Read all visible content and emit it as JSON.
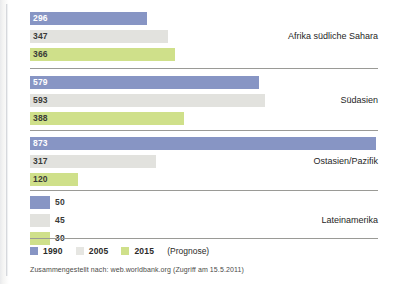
{
  "chart_data": {
    "type": "bar",
    "title": "",
    "xlabel": "",
    "ylabel": "",
    "orientation": "horizontal",
    "grid": false,
    "legend_position": "bottom-left",
    "xlim": [
      0,
      880
    ],
    "categories": [
      "Afrika südliche Sahara",
      "Südasien",
      "Ostasien/Pazifik",
      "Lateinamerika"
    ],
    "series": [
      {
        "name": "1990",
        "color": "#8795c4",
        "values": [
          296,
          579,
          873,
          50
        ]
      },
      {
        "name": "2005",
        "color": "#e2e2de",
        "values": [
          347,
          593,
          317,
          45
        ]
      },
      {
        "name": "2015",
        "color": "#cfe08a",
        "values": [
          366,
          388,
          120,
          30
        ]
      }
    ],
    "legend_note": "(Prognose)",
    "source": "Zusammengestellt nach: web.worldbank.org (Zugriff am 15.5.2011)"
  },
  "groups": [
    {
      "label": "Afrika südliche Sahara",
      "bars": [
        {
          "series": "1990",
          "value": "296"
        },
        {
          "series": "2005",
          "value": "347"
        },
        {
          "series": "2015",
          "value": "366"
        }
      ]
    },
    {
      "label": "Südasien",
      "bars": [
        {
          "series": "1990",
          "value": "579"
        },
        {
          "series": "2005",
          "value": "593"
        },
        {
          "series": "2015",
          "value": "388"
        }
      ]
    },
    {
      "label": "Ostasien/Pazifik",
      "bars": [
        {
          "series": "1990",
          "value": "873"
        },
        {
          "series": "2005",
          "value": "317"
        },
        {
          "series": "2015",
          "value": "120"
        }
      ]
    },
    {
      "label": "Lateinamerika",
      "bars": [
        {
          "series": "1990",
          "value": "50"
        },
        {
          "series": "2005",
          "value": "45"
        },
        {
          "series": "2015",
          "value": "30"
        }
      ]
    }
  ],
  "legend": {
    "items": [
      {
        "label": "1990",
        "color": "#8795c4"
      },
      {
        "label": "2005",
        "color": "#e6e6e2"
      },
      {
        "label": "2015",
        "color": "#cfe08a"
      }
    ],
    "note": "(Prognose)"
  },
  "source": "Zusammengestellt nach: web.worldbank.org (Zugriff am 15.5.2011)"
}
